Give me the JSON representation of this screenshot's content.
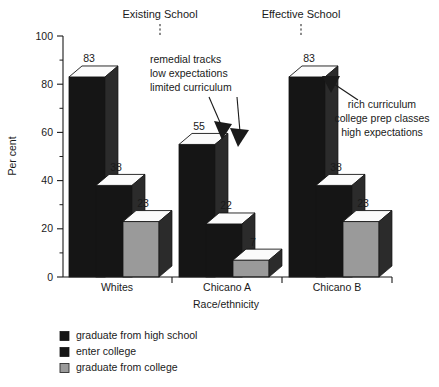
{
  "chart_data": {
    "type": "bar",
    "title": "",
    "xlabel": "Race/ethnicity",
    "ylabel": "Per cent",
    "ylim": [
      0,
      100
    ],
    "ytick_labels": [
      "0",
      "20",
      "40",
      "60",
      "80",
      "100"
    ],
    "ytick_values": [
      0,
      20,
      40,
      60,
      80,
      100
    ],
    "minor_tick_values": [
      10,
      30,
      50,
      70,
      90
    ],
    "grid": false,
    "legend_position": "bottom-left",
    "categories": [
      "Whites",
      "Chicano A",
      "Chicano B"
    ],
    "series": [
      {
        "name": "graduate from high school",
        "color": "#151515",
        "values": [
          83,
          55,
          83
        ]
      },
      {
        "name": "enter college",
        "color": "#151515",
        "values": [
          38,
          22,
          38
        ]
      },
      {
        "name": "graduate from college",
        "color": "#9a9a9a",
        "values": [
          23,
          7,
          23
        ]
      }
    ],
    "annotations": [
      {
        "id": "existing-school",
        "text": "Existing School",
        "target_category": "Chicano A"
      },
      {
        "id": "effective-school",
        "text": "Effective School",
        "target_category": "Chicano B"
      },
      {
        "id": "remedial-note",
        "lines": [
          "remedial tracks",
          "low expectations",
          "limited curriculum"
        ],
        "align": "left"
      },
      {
        "id": "rich-note",
        "lines": [
          "rich curriculum",
          "college prep classes",
          "high expectations"
        ],
        "align": "center"
      }
    ]
  },
  "legend": {
    "items": [
      {
        "label": "graduate from high school",
        "swatch": "dark"
      },
      {
        "label": "enter college",
        "swatch": "dark"
      },
      {
        "label": "graduate from college",
        "swatch": "gray"
      }
    ]
  },
  "axes": {
    "y_title": "Per cent",
    "x_title": "Race/ethnicity"
  },
  "top_labels": {
    "left": "Existing School",
    "right": "Effective School"
  },
  "value_labels": {
    "whites": [
      "83",
      "38",
      "23"
    ],
    "chicano_a": [
      "55",
      "22",
      "7"
    ],
    "chicano_b": [
      "83",
      "38",
      "23"
    ]
  }
}
